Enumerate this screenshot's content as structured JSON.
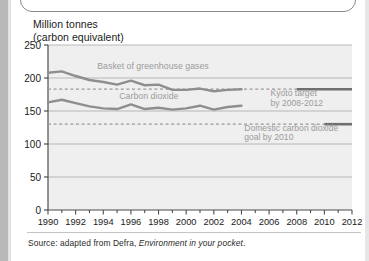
{
  "figure": {
    "y_axis_title": "Million tonnes\n(carbon equivalent)",
    "source": {
      "prefix": "Source: adapted from Defra, ",
      "italic": "Environment in your pocket",
      "suffix": "."
    }
  },
  "colors": {
    "series_line": "#8e8e8e",
    "target_line": "#9a9a9a",
    "gridline": "#a9a9a9",
    "axis": "#4d4d4d",
    "plot_bg": "#efefef",
    "label_text": "#9b9b9b",
    "tick_text": "#1a1a1a"
  },
  "chart_data": {
    "type": "line",
    "title": "",
    "xlabel": "",
    "ylabel": "Million tonnes (carbon equivalent)",
    "xlim": [
      1990,
      2012
    ],
    "ylim": [
      0,
      250
    ],
    "yticks": [
      0,
      50,
      100,
      150,
      200,
      250
    ],
    "xticks": [
      1990,
      1992,
      1994,
      1996,
      1998,
      2000,
      2002,
      2004,
      2006,
      2008,
      2010,
      2012
    ],
    "xtick_minor_step": 1,
    "grid": true,
    "legend": "inline-annotations",
    "series": [
      {
        "name": "Basket of greenhouse gases",
        "label_x": 1997.6,
        "label_y": 213,
        "x": [
          1990,
          1991,
          1992,
          1993,
          1994,
          1995,
          1996,
          1997,
          1998,
          1999,
          2000,
          2001,
          2002,
          2003,
          2004
        ],
        "values": [
          208,
          210,
          203,
          197,
          194,
          190,
          196,
          189,
          190,
          182,
          182,
          184,
          180,
          182,
          183
        ]
      },
      {
        "name": "Carbon dioxide",
        "label_x": 1997.3,
        "label_y": 168,
        "x": [
          1990,
          1991,
          1992,
          1993,
          1994,
          1995,
          1996,
          1997,
          1998,
          1999,
          2000,
          2001,
          2002,
          2003,
          2004
        ],
        "values": [
          163,
          167,
          162,
          157,
          154,
          153,
          160,
          153,
          155,
          152,
          154,
          158,
          152,
          156,
          158
        ]
      }
    ],
    "targets": [
      {
        "name": "Kyoto target by 2008-2012",
        "label": "Kyoto target\nby 2008-2012",
        "value": 183,
        "x_start": 1990,
        "x_dash_end": 2008,
        "x_solid_end": 2012,
        "label_x": 2006.1,
        "label_y": 172
      },
      {
        "name": "Domestic carbon dioxide goal by 2010",
        "label": "Domestic carbon dioxide\ngoal by 2010",
        "value": 130,
        "x_start": 1990,
        "x_dash_end": 2010,
        "x_solid_end": 2012,
        "label_x": 2004.2,
        "label_y": 120
      }
    ]
  }
}
